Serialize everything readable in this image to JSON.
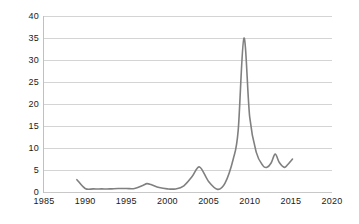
{
  "chart_data": {
    "type": "line",
    "title": "",
    "xlabel": "",
    "ylabel": "",
    "xlim": [
      1985,
      2020
    ],
    "ylim": [
      0,
      40
    ],
    "xticks": [
      1985,
      1990,
      1995,
      2000,
      2005,
      2010,
      2015,
      2020
    ],
    "yticks": [
      0,
      5,
      10,
      15,
      20,
      25,
      30,
      35,
      40
    ],
    "grid": true,
    "legend": "none",
    "line_color": "#808080",
    "series": [
      {
        "name": "series-1",
        "x": [
          1989.0,
          1990.0,
          1991.0,
          1992.0,
          1993.0,
          1994.0,
          1995.0,
          1996.0,
          1997.0,
          1997.5,
          1998.0,
          1999.0,
          2000.0,
          2001.0,
          2002.0,
          2003.0,
          2003.9,
          2005.0,
          2006.1,
          2007.0,
          2008.0,
          2008.6,
          2009.3,
          2010.0,
          2010.8,
          2011.6,
          2012.1,
          2012.6,
          2013.1,
          2013.6,
          2014.2,
          2014.6,
          2015.2
        ],
        "values": [
          2.8,
          0.8,
          0.7,
          0.7,
          0.7,
          0.8,
          0.8,
          0.8,
          1.5,
          1.9,
          1.7,
          1.0,
          0.7,
          0.7,
          1.4,
          3.5,
          5.7,
          2.4,
          0.6,
          2.0,
          7.5,
          14.0,
          35.0,
          17.0,
          9.0,
          6.0,
          5.6,
          6.6,
          8.6,
          6.7,
          5.6,
          6.2,
          7.5
        ]
      }
    ]
  },
  "axis": {
    "y_labels": [
      "40",
      "35",
      "30",
      "25",
      "20",
      "15",
      "10",
      "5",
      "0"
    ],
    "x_labels": [
      "1985",
      "1990",
      "1995",
      "2000",
      "2005",
      "2010",
      "2015",
      "2020"
    ]
  },
  "colors": {
    "line": "#808080",
    "grid": "#d4d4d4",
    "axis": "#c0c0c0",
    "text": "#1a1a1a",
    "background": "#ffffff"
  }
}
